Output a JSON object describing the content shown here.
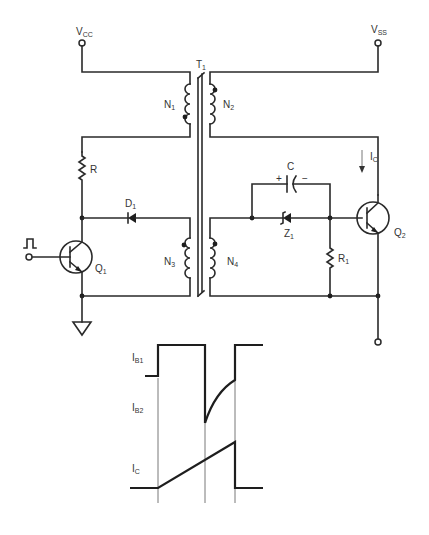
{
  "supplies": {
    "vcc": {
      "main": "V",
      "sub": "CC"
    },
    "vss": {
      "main": "V",
      "sub": "SS"
    }
  },
  "transformer": {
    "label": {
      "main": "T",
      "sub": "1"
    },
    "windings": [
      {
        "main": "N",
        "sub": "1"
      },
      {
        "main": "N",
        "sub": "2"
      },
      {
        "main": "N",
        "sub": "3"
      },
      {
        "main": "N",
        "sub": "4"
      }
    ]
  },
  "components": {
    "resistor_r": {
      "main": "R"
    },
    "diode_d1": {
      "main": "D",
      "sub": "1"
    },
    "transistor_q1": {
      "main": "Q",
      "sub": "1"
    },
    "capacitor_c": {
      "main": "C",
      "plus": "+",
      "minus": "−"
    },
    "zener_z1": {
      "main": "Z",
      "sub": "1"
    },
    "resistor_r1": {
      "main": "R",
      "sub": "1"
    },
    "transistor_q2": {
      "main": "Q",
      "sub": "2"
    },
    "collector_current": {
      "main": "I",
      "sub": "C"
    },
    "input_pulse_icon": "pulse-symbol",
    "ground_icon": "ground-triangle"
  },
  "waveform": {
    "labels": [
      {
        "main": "I",
        "sub": "B1"
      },
      {
        "main": "I",
        "sub": "B2"
      },
      {
        "main": "I",
        "sub": "C"
      }
    ]
  }
}
